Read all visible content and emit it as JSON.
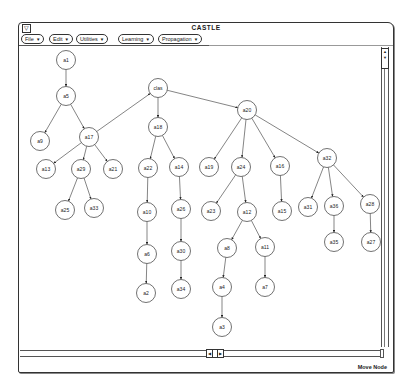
{
  "window": {
    "title": "CASTLE",
    "menu_button_glyph": "▽"
  },
  "menubar": {
    "items": [
      {
        "label": "File",
        "arrow": "▼"
      },
      {
        "label": "Edit",
        "arrow": "▼"
      },
      {
        "label": "Utilities",
        "arrow": "▼"
      },
      {
        "label": "Learning",
        "arrow": "▼"
      },
      {
        "label": "Propagation",
        "arrow": "▼"
      }
    ]
  },
  "scrollbars": {
    "vertical": {
      "up_glyph": "▲",
      "down_glyph": "▼"
    },
    "horizontal": {
      "left_glyph": "◀",
      "right_glyph": "▶"
    }
  },
  "status": {
    "mode": "Move Node"
  },
  "graph": {
    "nodes": [
      {
        "id": "a1",
        "label": "a1"
      },
      {
        "id": "a5",
        "label": "a5"
      },
      {
        "id": "a9",
        "label": "a9"
      },
      {
        "id": "a17",
        "label": "a17"
      },
      {
        "id": "a13",
        "label": "a13"
      },
      {
        "id": "a29",
        "label": "a29"
      },
      {
        "id": "a21",
        "label": "a21"
      },
      {
        "id": "a25",
        "label": "a25"
      },
      {
        "id": "a33",
        "label": "a33"
      },
      {
        "id": "clas",
        "label": "clas"
      },
      {
        "id": "a18",
        "label": "a18"
      },
      {
        "id": "a22",
        "label": "a22"
      },
      {
        "id": "a14",
        "label": "a14"
      },
      {
        "id": "a10",
        "label": "a10"
      },
      {
        "id": "a26",
        "label": "a26"
      },
      {
        "id": "a6",
        "label": "a6"
      },
      {
        "id": "a30",
        "label": "a30"
      },
      {
        "id": "a2",
        "label": "a2"
      },
      {
        "id": "a34",
        "label": "a34"
      },
      {
        "id": "a20",
        "label": "a20"
      },
      {
        "id": "a19",
        "label": "a19"
      },
      {
        "id": "a24",
        "label": "a24"
      },
      {
        "id": "a16",
        "label": "a16"
      },
      {
        "id": "a32",
        "label": "a32"
      },
      {
        "id": "a23",
        "label": "a23"
      },
      {
        "id": "a12",
        "label": "a12"
      },
      {
        "id": "a15",
        "label": "a15"
      },
      {
        "id": "a31",
        "label": "a31"
      },
      {
        "id": "a36",
        "label": "a36"
      },
      {
        "id": "a28",
        "label": "a28"
      },
      {
        "id": "a35",
        "label": "a35"
      },
      {
        "id": "a27",
        "label": "a27"
      },
      {
        "id": "a8",
        "label": "a8"
      },
      {
        "id": "a11",
        "label": "a11"
      },
      {
        "id": "a4",
        "label": "a4"
      },
      {
        "id": "a7",
        "label": "a7"
      },
      {
        "id": "a3",
        "label": "a3"
      }
    ],
    "edges": [
      [
        "a1",
        "a5"
      ],
      [
        "a5",
        "a9"
      ],
      [
        "a5",
        "a17"
      ],
      [
        "a17",
        "a13"
      ],
      [
        "a17",
        "a29"
      ],
      [
        "a17",
        "a21"
      ],
      [
        "a17",
        "clas"
      ],
      [
        "a29",
        "a25"
      ],
      [
        "a29",
        "a33"
      ],
      [
        "clas",
        "a18"
      ],
      [
        "clas",
        "a20"
      ],
      [
        "a18",
        "a22"
      ],
      [
        "a18",
        "a14"
      ],
      [
        "a22",
        "a10"
      ],
      [
        "a10",
        "a6"
      ],
      [
        "a6",
        "a2"
      ],
      [
        "a14",
        "a26"
      ],
      [
        "a26",
        "a30"
      ],
      [
        "a30",
        "a34"
      ],
      [
        "a20",
        "a19"
      ],
      [
        "a20",
        "a24"
      ],
      [
        "a20",
        "a16"
      ],
      [
        "a20",
        "a32"
      ],
      [
        "a24",
        "a23"
      ],
      [
        "a24",
        "a12"
      ],
      [
        "a12",
        "a8"
      ],
      [
        "a12",
        "a11"
      ],
      [
        "a8",
        "a4"
      ],
      [
        "a4",
        "a3"
      ],
      [
        "a11",
        "a7"
      ],
      [
        "a16",
        "a15"
      ],
      [
        "a32",
        "a31"
      ],
      [
        "a32",
        "a36"
      ],
      [
        "a32",
        "a28"
      ],
      [
        "a36",
        "a35"
      ],
      [
        "a28",
        "a27"
      ]
    ]
  }
}
